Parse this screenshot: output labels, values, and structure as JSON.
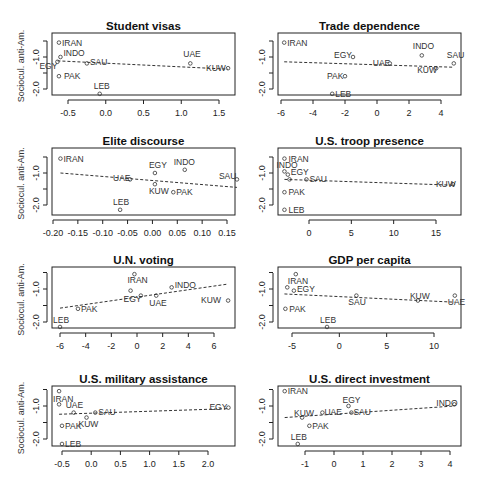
{
  "figure": {
    "ylabel": "Sociocul. anti-Am.",
    "yticks": [
      -1.0,
      -2.0
    ],
    "ytick_labels": [
      "-1.0",
      "-2.0"
    ]
  },
  "chart_data": [
    {
      "type": "scatter",
      "title": "Student visas",
      "xlabel": "",
      "ylabel": "Sociocul. anti-Am.",
      "xticks": [
        -0.5,
        0.0,
        0.5,
        1.0,
        1.5
      ],
      "xtick_labels": [
        "-0.5",
        "0.0",
        "0.5",
        "1.0",
        "1.5"
      ],
      "points": [
        {
          "label": "IRAN",
          "x": -0.62,
          "y": -0.55
        },
        {
          "label": "INDO",
          "x": -0.6,
          "y": -1.0
        },
        {
          "label": "EGY",
          "x": -0.64,
          "y": -1.15
        },
        {
          "label": "SAU",
          "x": -0.25,
          "y": -1.2
        },
        {
          "label": "PAK",
          "x": -0.62,
          "y": -1.6
        },
        {
          "label": "LEB",
          "x": -0.08,
          "y": -2.15
        },
        {
          "label": "UAE",
          "x": 1.12,
          "y": -1.2
        },
        {
          "label": "KUW",
          "x": 1.62,
          "y": -1.35
        }
      ],
      "fit_line": {
        "x": [
          -0.64,
          1.62
        ],
        "y": [
          -1.12,
          -1.38
        ]
      }
    },
    {
      "type": "scatter",
      "title": "Trade dependence",
      "xlabel": "",
      "ylabel": "",
      "xticks": [
        -6,
        -4,
        -2,
        0,
        2,
        4
      ],
      "xtick_labels": [
        "-6",
        "-4",
        "-2",
        "0",
        "2",
        "4"
      ],
      "points": [
        {
          "label": "IRAN",
          "x": -5.8,
          "y": -0.55
        },
        {
          "label": "EGY",
          "x": -1.5,
          "y": -1.0
        },
        {
          "label": "PAK",
          "x": -2.0,
          "y": -1.6
        },
        {
          "label": "LEB",
          "x": -2.8,
          "y": -2.15
        },
        {
          "label": "UAE",
          "x": 0.8,
          "y": -1.2
        },
        {
          "label": "INDO",
          "x": 2.8,
          "y": -0.95
        },
        {
          "label": "KUW",
          "x": 3.7,
          "y": -1.35
        },
        {
          "label": "SAU",
          "x": 4.8,
          "y": -1.2
        }
      ],
      "fit_line": {
        "x": [
          -5.8,
          4.8
        ],
        "y": [
          -1.15,
          -1.32
        ]
      }
    },
    {
      "type": "scatter",
      "title": "Elite discourse",
      "xlabel": "",
      "ylabel": "Sociocul. anti-Am.",
      "xticks": [
        -0.2,
        -0.15,
        -0.1,
        -0.05,
        0.0,
        0.05,
        0.1,
        0.15
      ],
      "xtick_labels": [
        "-0.20",
        "-0.15",
        "-0.10",
        "-0.05",
        "0.00",
        "0.05",
        "0.10",
        "0.15"
      ],
      "points": [
        {
          "label": "IRAN",
          "x": -0.185,
          "y": -0.55
        },
        {
          "label": "UAE",
          "x": -0.045,
          "y": -1.2
        },
        {
          "label": "EGY",
          "x": 0.005,
          "y": -1.0
        },
        {
          "label": "KUW",
          "x": 0.005,
          "y": -1.35
        },
        {
          "label": "INDO",
          "x": 0.065,
          "y": -0.9
        },
        {
          "label": "PAK",
          "x": 0.042,
          "y": -1.6
        },
        {
          "label": "SAU",
          "x": 0.17,
          "y": -1.2
        },
        {
          "label": "LEB",
          "x": -0.065,
          "y": -2.15
        }
      ],
      "fit_line": {
        "x": [
          -0.185,
          0.17
        ],
        "y": [
          -1.0,
          -1.45
        ]
      }
    },
    {
      "type": "scatter",
      "title": "U.S. troop presence",
      "xlabel": "",
      "ylabel": "",
      "xticks": [
        0,
        5,
        10,
        15
      ],
      "xtick_labels": [
        "0",
        "5",
        "10",
        "15"
      ],
      "points": [
        {
          "label": "IRAN",
          "x": -2.9,
          "y": -0.55
        },
        {
          "label": "INDO",
          "x": -2.9,
          "y": -0.95
        },
        {
          "label": "EGY",
          "x": -2.5,
          "y": -1.05
        },
        {
          "label": "UAE",
          "x": -2.3,
          "y": -1.2
        },
        {
          "label": "SAU",
          "x": -0.3,
          "y": -1.2
        },
        {
          "label": "PAK",
          "x": -2.9,
          "y": -1.6
        },
        {
          "label": "LEB",
          "x": -2.9,
          "y": -2.15
        },
        {
          "label": "KUW",
          "x": 17.0,
          "y": -1.35
        }
      ],
      "fit_line": {
        "x": [
          -2.9,
          17.0
        ],
        "y": [
          -1.2,
          -1.38
        ]
      }
    },
    {
      "type": "scatter",
      "title": "U.N. voting",
      "xlabel": "",
      "ylabel": "Sociocul. anti-Am.",
      "xticks": [
        -6,
        -4,
        -2,
        0,
        2,
        4,
        6
      ],
      "xtick_labels": [
        "-6",
        "-4",
        "-2",
        "0",
        "2",
        "4",
        "6"
      ],
      "points": [
        {
          "label": "IRAN",
          "x": -0.2,
          "y": -0.55
        },
        {
          "label": "EGY",
          "x": -0.5,
          "y": -1.05
        },
        {
          "label": "SAU",
          "x": 0.3,
          "y": -1.2
        },
        {
          "label": "UAE",
          "x": 1.5,
          "y": -1.2
        },
        {
          "label": "INDO",
          "x": 2.7,
          "y": -0.95
        },
        {
          "label": "KUW",
          "x": 7.1,
          "y": -1.35
        },
        {
          "label": "PAK",
          "x": -4.6,
          "y": -1.6
        },
        {
          "label": "LEB",
          "x": -6.0,
          "y": -2.15
        }
      ],
      "fit_line": {
        "x": [
          -6.0,
          7.1
        ],
        "y": [
          -1.58,
          -0.85
        ]
      }
    },
    {
      "type": "scatter",
      "title": "GDP per capita",
      "xlabel": "",
      "ylabel": "",
      "xticks": [
        -5,
        0,
        5,
        10
      ],
      "xtick_labels": [
        "-5",
        "0",
        "5",
        "10"
      ],
      "points": [
        {
          "label": "IRAN",
          "x": -4.6,
          "y": -0.55
        },
        {
          "label": "INDO",
          "x": -5.5,
          "y": -0.95
        },
        {
          "label": "EGY",
          "x": -4.8,
          "y": -1.05
        },
        {
          "label": "SAU",
          "x": 1.8,
          "y": -1.2
        },
        {
          "label": "KUW",
          "x": 8.3,
          "y": -1.35
        },
        {
          "label": "UAE",
          "x": 12.2,
          "y": -1.2
        },
        {
          "label": "PAK",
          "x": -5.7,
          "y": -1.6
        },
        {
          "label": "LEB",
          "x": -1.3,
          "y": -2.15
        }
      ],
      "fit_line": {
        "x": [
          -5.8,
          12.2
        ],
        "y": [
          -1.15,
          -1.4
        ]
      }
    },
    {
      "type": "scatter",
      "title": "U.S. military assistance",
      "xlabel": "",
      "ylabel": "Sociocul. anti-Am.",
      "xticks": [
        -0.5,
        0.0,
        0.5,
        1.0,
        1.5,
        2.0
      ],
      "xtick_labels": [
        "-0.5",
        "0.0",
        "0.5",
        "1.0",
        "1.5",
        "2.0"
      ],
      "points": [
        {
          "label": "IRAN",
          "x": -0.55,
          "y": -0.55
        },
        {
          "label": "INDO",
          "x": -0.55,
          "y": -0.95
        },
        {
          "label": "UAE",
          "x": -0.3,
          "y": -1.2
        },
        {
          "label": "SAU",
          "x": 0.07,
          "y": -1.2
        },
        {
          "label": "KUW",
          "x": -0.08,
          "y": -1.35
        },
        {
          "label": "PAK",
          "x": -0.5,
          "y": -1.6
        },
        {
          "label": "LEB",
          "x": -0.5,
          "y": -2.15
        },
        {
          "label": "EGY",
          "x": 2.35,
          "y": -1.05
        }
      ],
      "fit_line": {
        "x": [
          -0.55,
          2.35
        ],
        "y": [
          -1.25,
          -1.08
        ]
      }
    },
    {
      "type": "scatter",
      "title": "U.S. direct investment",
      "xlabel": "",
      "ylabel": "",
      "xticks": [
        -1,
        0,
        1,
        2,
        3,
        4
      ],
      "xtick_labels": [
        "-1",
        "0",
        "1",
        "2",
        "3",
        "4"
      ],
      "points": [
        {
          "label": "IRAN",
          "x": -1.7,
          "y": -0.55
        },
        {
          "label": "KUW",
          "x": -1.1,
          "y": -1.35
        },
        {
          "label": "UAE",
          "x": -0.4,
          "y": -1.2
        },
        {
          "label": "EGY",
          "x": 0.5,
          "y": -1.0
        },
        {
          "label": "SAU",
          "x": 0.6,
          "y": -1.2
        },
        {
          "label": "PAK",
          "x": -0.85,
          "y": -1.6
        },
        {
          "label": "LEB",
          "x": -1.25,
          "y": -2.15
        },
        {
          "label": "INDO",
          "x": 4.15,
          "y": -0.95
        }
      ],
      "fit_line": {
        "x": [
          -1.7,
          4.15
        ],
        "y": [
          -1.35,
          -1.0
        ]
      }
    }
  ]
}
